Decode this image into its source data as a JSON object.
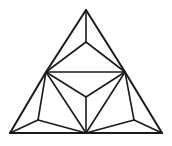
{
  "figure": {
    "shape_type": "line-drawing",
    "stroke_color": "#1a1a1a",
    "background_color": "#ffffff",
    "stroke_width": 1.6,
    "outer_stroke_width": 2.0,
    "canvas": {
      "width": 172,
      "height": 146
    },
    "vertices": {
      "apex": {
        "name": "top-apex",
        "x": 86,
        "y": 10
      },
      "upper_center": {
        "name": "upper-y-junction",
        "x": 86,
        "y": 42
      },
      "mid_left": {
        "name": "left-edge-midpoint",
        "x": 46,
        "y": 72
      },
      "mid_right": {
        "name": "right-edge-midpoint",
        "x": 125,
        "y": 72
      },
      "core_center": {
        "name": "central-y-junction",
        "x": 86,
        "y": 97
      },
      "low_left": {
        "name": "lower-left-node",
        "x": 38,
        "y": 120
      },
      "low_right": {
        "name": "lower-right-node",
        "x": 134,
        "y": 120
      },
      "bottom_left": {
        "name": "bottom-left-corner",
        "x": 10,
        "y": 133
      },
      "bottom_center": {
        "name": "bottom-center-node",
        "x": 86,
        "y": 133
      },
      "bottom_right": {
        "name": "bottom-right-corner",
        "x": 162,
        "y": 133
      }
    },
    "edges": [
      {
        "id": "outer-left-upper",
        "from": "apex",
        "to": "mid_left",
        "outer": true
      },
      {
        "id": "outer-left-lower",
        "from": "mid_left",
        "to": "bottom_left",
        "outer": true
      },
      {
        "id": "outer-right-upper",
        "from": "apex",
        "to": "mid_right",
        "outer": true
      },
      {
        "id": "outer-right-lower",
        "from": "mid_right",
        "to": "bottom_right",
        "outer": true
      },
      {
        "id": "outer-base-left",
        "from": "bottom_left",
        "to": "bottom_center",
        "outer": true
      },
      {
        "id": "outer-base-right",
        "from": "bottom_center",
        "to": "bottom_right",
        "outer": true
      },
      {
        "id": "mid-horizontal",
        "from": "mid_left",
        "to": "mid_right",
        "outer": false
      },
      {
        "id": "apex-vertical",
        "from": "apex",
        "to": "upper_center",
        "outer": false
      },
      {
        "id": "upper-y-left",
        "from": "upper_center",
        "to": "mid_left",
        "outer": false
      },
      {
        "id": "upper-y-right",
        "from": "upper_center",
        "to": "mid_right",
        "outer": false
      },
      {
        "id": "core-y-left",
        "from": "core_center",
        "to": "mid_left",
        "outer": false
      },
      {
        "id": "core-y-right",
        "from": "core_center",
        "to": "mid_right",
        "outer": false
      },
      {
        "id": "core-y-down",
        "from": "core_center",
        "to": "bottom_center",
        "outer": false
      },
      {
        "id": "midleft-to-bcenter",
        "from": "mid_left",
        "to": "bottom_center",
        "outer": false
      },
      {
        "id": "midright-to-bcenter",
        "from": "mid_right",
        "to": "bottom_center",
        "outer": false
      },
      {
        "id": "midleft-to-lowleft",
        "from": "mid_left",
        "to": "low_left",
        "outer": false
      },
      {
        "id": "midright-to-lowright",
        "from": "mid_right",
        "to": "low_right",
        "outer": false
      },
      {
        "id": "lowleft-to-bleft",
        "from": "low_left",
        "to": "bottom_left",
        "outer": false
      },
      {
        "id": "lowleft-to-bcenter",
        "from": "low_left",
        "to": "bottom_center",
        "outer": false
      },
      {
        "id": "lowright-to-bright",
        "from": "low_right",
        "to": "bottom_right",
        "outer": false
      },
      {
        "id": "lowright-to-bcenter",
        "from": "low_right",
        "to": "bottom_center",
        "outer": false
      }
    ]
  }
}
